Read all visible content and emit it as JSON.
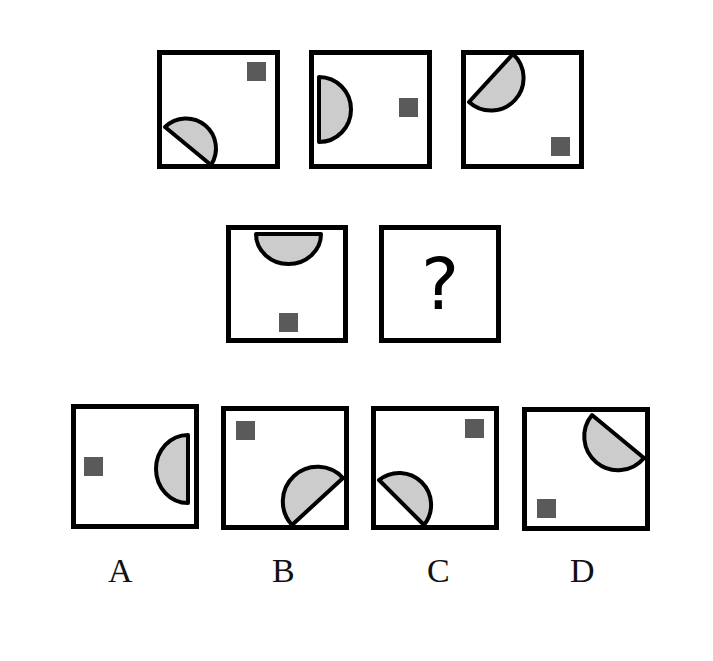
{
  "colors": {
    "border": "#000000",
    "semicircle_fill": "#cccccc",
    "square_fill": "#5a5a5a",
    "background": "#ffffff"
  },
  "puzzle": {
    "row1": [
      {
        "id": "q1",
        "semicircle": "bottom-left, flat edge on diagonal from left edge to bottom edge",
        "square": "top-right"
      },
      {
        "id": "q2",
        "semicircle": "left edge, flat side against left wall",
        "square": "middle-right"
      },
      {
        "id": "q3",
        "semicircle": "top-left, flat edge on diagonal from left edge to top edge",
        "square": "bottom-right"
      }
    ],
    "row2": [
      {
        "id": "q4",
        "semicircle": "top edge, flat side against top wall",
        "square": "bottom-center"
      },
      {
        "id": "q5",
        "content": "?"
      }
    ]
  },
  "options": [
    {
      "label": "A",
      "semicircle": "right edge, flat side against right wall",
      "square": "middle-left"
    },
    {
      "label": "B",
      "semicircle": "bottom-right, flat edge on diagonal from bottom edge to right edge",
      "square": "top-left"
    },
    {
      "label": "C",
      "semicircle": "bottom-left, flat edge on diagonal from left edge to bottom edge",
      "square": "top-right"
    },
    {
      "label": "D",
      "semicircle": "top-right, flat edge on diagonal from top edge to right edge",
      "square": "bottom-left"
    }
  ]
}
